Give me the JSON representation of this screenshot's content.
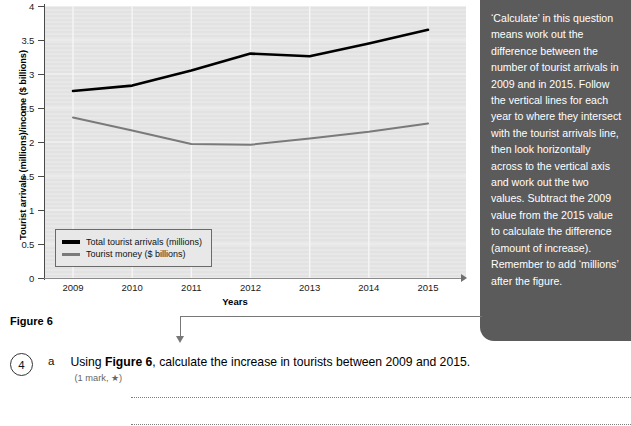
{
  "chart_data": {
    "type": "line",
    "title": "",
    "xlabel": "Years",
    "ylabel": "Tourist arrivals (millions)/income ($ billions)",
    "categories": [
      "2009",
      "2010",
      "2011",
      "2012",
      "2013",
      "2014",
      "2015"
    ],
    "ylim": [
      0,
      4
    ],
    "y_ticks": [
      "0",
      "0.5",
      "1",
      "1.5",
      "2",
      "2.5",
      "3",
      "3.5",
      "4"
    ],
    "grid": true,
    "legend_position": "bottom-left",
    "series": [
      {
        "name": "Total tourist arrivals (millions)",
        "color": "#000000",
        "values": [
          2.75,
          2.83,
          3.05,
          3.3,
          3.26,
          3.45,
          3.65
        ]
      },
      {
        "name": "Tourist money ($ billions)",
        "color": "#7a7a7a",
        "values": [
          2.36,
          2.17,
          1.97,
          1.96,
          2.05,
          2.15,
          2.27
        ]
      }
    ]
  },
  "figure": {
    "caption": "Figure 6"
  },
  "callout": {
    "text": "‘Calculate’ in this question means work out the difference between the number of tourist arrivals in 2009 and in 2015. Follow the vertical lines for each year to where they intersect with the tourist arrivals line, then look horizontally across to the vertical axis and work out the two values. Subtract the 2009 value from the 2015 value to calculate the difference (amount of increase). Remember to add ‘millions’ after the figure.",
    "background": "#5b5b5b"
  },
  "question": {
    "number": "4",
    "letter": "a",
    "text_before": "Using ",
    "text_bold": "Figure 6",
    "text_after": ", calculate the increase in tourists between 2009 and 2015.",
    "marks": "(1 mark, ★)"
  }
}
